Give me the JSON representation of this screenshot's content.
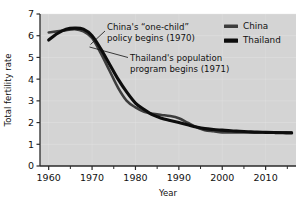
{
  "chart_data": {
    "type": "line",
    "title": "",
    "xlabel": "Year",
    "ylabel": "Total fertility rate",
    "xlim": [
      1958,
      2017
    ],
    "ylim": [
      0,
      7
    ],
    "grid": true,
    "legend_position": "top-right",
    "x_ticks": [
      1960,
      1970,
      1980,
      1990,
      2000,
      2010
    ],
    "x_tick_labels": [
      "1960",
      "1970",
      "1980",
      "1990",
      "2000",
      "2010"
    ],
    "x_minor_ticks": [
      1965,
      1975,
      1985,
      1995,
      2005,
      2015
    ],
    "y_ticks": [
      0,
      1,
      2,
      3,
      4,
      5,
      6,
      7
    ],
    "y_tick_labels": [
      "0",
      "1",
      "2",
      "3",
      "4",
      "5",
      "6",
      "7"
    ],
    "series": [
      {
        "name": "China",
        "color": "#3d3d3d",
        "x": [
          1960,
          1962,
          1964,
          1966,
          1968,
          1970,
          1972,
          1974,
          1976,
          1978,
          1980,
          1982,
          1984,
          1986,
          1988,
          1990,
          1992,
          1994,
          1996,
          1998,
          2000,
          2002,
          2004,
          2006,
          2008,
          2010,
          2012,
          2014,
          2016
        ],
        "values": [
          6.15,
          6.2,
          6.25,
          6.3,
          6.2,
          5.9,
          5.2,
          4.4,
          3.6,
          3.0,
          2.7,
          2.5,
          2.4,
          2.35,
          2.3,
          2.2,
          2.0,
          1.8,
          1.65,
          1.6,
          1.55,
          1.55,
          1.55,
          1.55,
          1.55,
          1.55,
          1.55,
          1.55,
          1.55
        ]
      },
      {
        "name": "Thailand",
        "color": "#0d0d0d",
        "x": [
          1960,
          1962,
          1964,
          1966,
          1968,
          1970,
          1972,
          1974,
          1976,
          1978,
          1980,
          1982,
          1984,
          1986,
          1988,
          1990,
          1992,
          1994,
          1996,
          1998,
          2000,
          2002,
          2004,
          2006,
          2008,
          2010,
          2012,
          2014,
          2016
        ],
        "values": [
          5.8,
          6.1,
          6.3,
          6.35,
          6.3,
          6.0,
          5.4,
          4.7,
          4.0,
          3.4,
          2.9,
          2.6,
          2.35,
          2.2,
          2.1,
          2.0,
          1.9,
          1.8,
          1.72,
          1.68,
          1.65,
          1.62,
          1.6,
          1.58,
          1.56,
          1.55,
          1.54,
          1.53,
          1.52
        ]
      }
    ],
    "annotations": [
      {
        "id": "china-policy",
        "line1": "China's “one-child”",
        "line2": "policy begins (1970)",
        "target_year": 1970
      },
      {
        "id": "thailand-program",
        "line1": "Thailand's population",
        "line2": "program begins (1971)",
        "target_year": 1971
      }
    ]
  },
  "legend": {
    "items": [
      {
        "label": "China",
        "color": "#3d3d3d"
      },
      {
        "label": "Thailand",
        "color": "#0d0d0d"
      }
    ]
  },
  "axes": {
    "x_title": "Year",
    "y_title": "Total fertility rate"
  },
  "style": {
    "plot_background": "#d4d4d4",
    "grid_color": "#e8e8e8",
    "axis_color": "#2a2a2a",
    "page_background": "#ffffff"
  }
}
